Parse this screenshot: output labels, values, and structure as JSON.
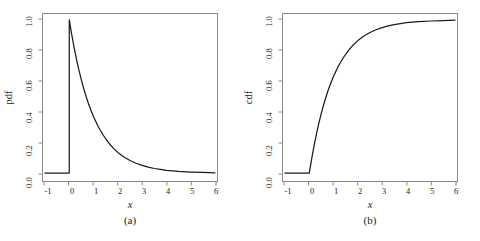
{
  "figure": {
    "background_color": "#ffffff",
    "line_color": "#1a1a1a",
    "axis_color": "#8a8a8a"
  },
  "panels": [
    {
      "caption": "(a)",
      "xlabel": "x",
      "ylabel": "pdf"
    },
    {
      "caption": "(b)",
      "xlabel": "x",
      "ylabel": "cdf"
    }
  ],
  "axis": {
    "x_ticks": [
      "-1",
      "0",
      "1",
      "2",
      "3",
      "4",
      "5",
      "6"
    ],
    "y_ticks": [
      "0.0",
      "0.2",
      "0.4",
      "0.6",
      "0.8",
      "1.0"
    ]
  },
  "chart_data": [
    {
      "type": "line",
      "title": "",
      "subtitle": "",
      "panel_caption": "(a)",
      "xlabel": "x",
      "ylabel": "pdf",
      "xlim": [
        -1,
        6
      ],
      "ylim": [
        0.0,
        1.0
      ],
      "xticks": [
        -1,
        0,
        1,
        2,
        3,
        4,
        5,
        6
      ],
      "yticks": [
        0.0,
        0.2,
        0.4,
        0.6,
        0.8,
        1.0
      ],
      "grid": false,
      "legend": null,
      "description": "Probability density function of the standard exponential distribution: f(x) = 0 for x < 0, f(x) = exp(-x) for x >= 0. Vertical jump from 0 to 1.0 at x = 0.",
      "series": [
        {
          "name": "pdf",
          "x": [
            -1.0,
            -0.8,
            -0.6,
            -0.4,
            -0.2,
            -0.05,
            0.0,
            0.0,
            0.1,
            0.2,
            0.3,
            0.4,
            0.5,
            0.6,
            0.7,
            0.8,
            0.9,
            1.0,
            1.2,
            1.4,
            1.6,
            1.8,
            2.0,
            2.25,
            2.5,
            2.75,
            3.0,
            3.25,
            3.5,
            3.75,
            4.0,
            4.5,
            5.0,
            5.5,
            6.0
          ],
          "values": [
            0.0,
            0.0,
            0.0,
            0.0,
            0.0,
            0.0,
            0.0,
            1.0,
            0.905,
            0.819,
            0.741,
            0.67,
            0.607,
            0.549,
            0.497,
            0.449,
            0.407,
            0.368,
            0.301,
            0.247,
            0.202,
            0.165,
            0.135,
            0.105,
            0.082,
            0.064,
            0.05,
            0.039,
            0.03,
            0.024,
            0.018,
            0.011,
            0.007,
            0.004,
            0.002
          ]
        }
      ]
    },
    {
      "type": "line",
      "title": "",
      "subtitle": "",
      "panel_caption": "(b)",
      "xlabel": "x",
      "ylabel": "cdf",
      "xlim": [
        -1,
        6
      ],
      "ylim": [
        0.0,
        1.0
      ],
      "xticks": [
        -1,
        0,
        1,
        2,
        3,
        4,
        5,
        6
      ],
      "yticks": [
        0.0,
        0.2,
        0.4,
        0.6,
        0.8,
        1.0
      ],
      "grid": false,
      "legend": null,
      "description": "Cumulative distribution function of the standard exponential distribution: F(x) = 0 for x < 0, F(x) = 1 - exp(-x) for x >= 0.",
      "series": [
        {
          "name": "cdf",
          "x": [
            -1.0,
            -0.8,
            -0.6,
            -0.4,
            -0.2,
            0.0,
            0.1,
            0.2,
            0.3,
            0.4,
            0.5,
            0.6,
            0.7,
            0.8,
            0.9,
            1.0,
            1.2,
            1.4,
            1.6,
            1.8,
            2.0,
            2.25,
            2.5,
            2.75,
            3.0,
            3.25,
            3.5,
            3.75,
            4.0,
            4.5,
            5.0,
            5.5,
            6.0
          ],
          "values": [
            0.0,
            0.0,
            0.0,
            0.0,
            0.0,
            0.0,
            0.095,
            0.181,
            0.259,
            0.33,
            0.393,
            0.451,
            0.503,
            0.551,
            0.593,
            0.632,
            0.699,
            0.753,
            0.798,
            0.835,
            0.865,
            0.895,
            0.918,
            0.936,
            0.95,
            0.961,
            0.97,
            0.976,
            0.982,
            0.989,
            0.993,
            0.996,
            0.998
          ]
        }
      ]
    }
  ]
}
